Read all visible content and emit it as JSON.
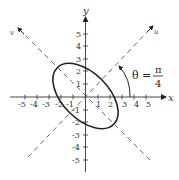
{
  "diagram": {
    "axes": {
      "x_label": "x",
      "y_label": "y",
      "u_label": "u",
      "v_label": "v",
      "x_ticks": [
        "-5",
        "-4",
        "-3",
        "-2",
        "-1",
        "1",
        "2",
        "3",
        "4",
        "5"
      ],
      "y_ticks": [
        "5",
        "4",
        "3",
        "2",
        "1",
        "-1",
        "-2",
        "-3",
        "-4",
        "-5"
      ]
    },
    "annotation": {
      "theta_lhs": "θ =",
      "theta_num": "π",
      "theta_den": "4"
    },
    "ellipse": {
      "rotation_deg": -45,
      "description": "Ellipse centered at origin, major axis along the v axis"
    },
    "colors": {
      "stroke": "#222222",
      "dashed": "#555555",
      "background": "#ffffff"
    }
  }
}
